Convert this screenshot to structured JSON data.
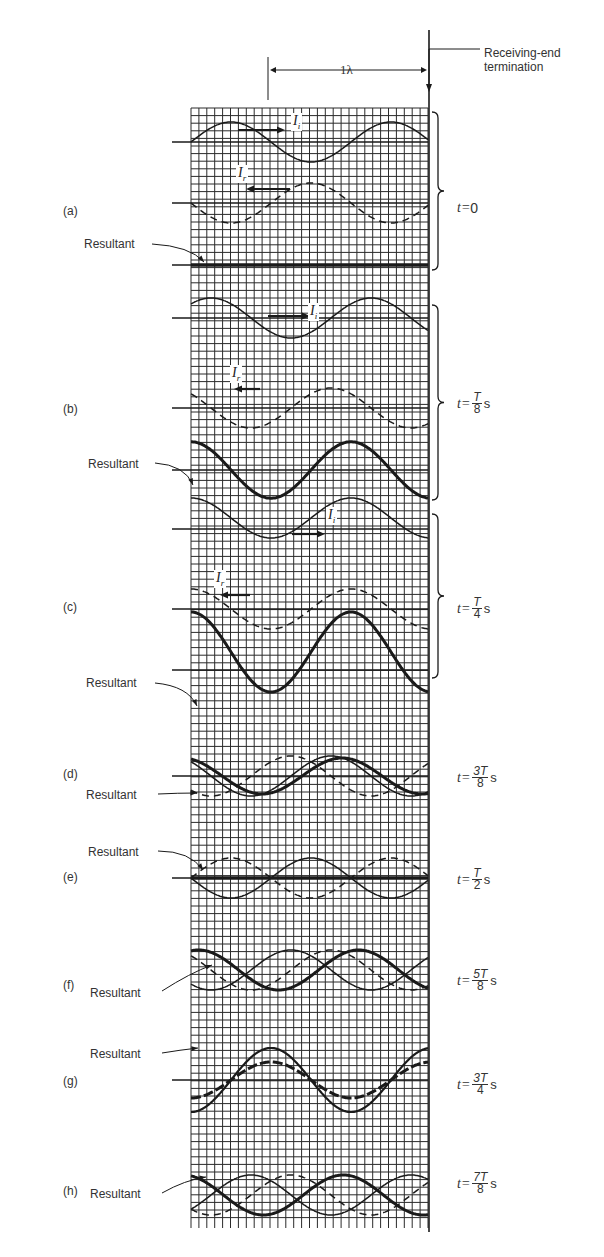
{
  "figure": {
    "wavelength_label": "1λ",
    "termination_label_line1": "Receiving-end",
    "termination_label_line2": "termination",
    "incident_symbol": "I",
    "incident_sub": "i",
    "reflected_symbol": "I",
    "reflected_sub": "r",
    "resultant_label": "Resultant"
  },
  "panels": [
    {
      "id": "a",
      "letter": "(a)",
      "time_prefix": "t=",
      "time_value": "0",
      "time_num": "",
      "time_den": "",
      "time_unit": ""
    },
    {
      "id": "b",
      "letter": "(b)",
      "time_prefix": "t=",
      "time_value": "",
      "time_num": "T",
      "time_den": "8",
      "time_unit": "s"
    },
    {
      "id": "c",
      "letter": "(c)",
      "time_prefix": "t=",
      "time_value": "",
      "time_num": "T",
      "time_den": "4",
      "time_unit": "s"
    },
    {
      "id": "d",
      "letter": "(d)",
      "time_prefix": "t=",
      "time_value": "",
      "time_num": "3T",
      "time_den": "8",
      "time_unit": "s"
    },
    {
      "id": "e",
      "letter": "(e)",
      "time_prefix": "t=",
      "time_value": "",
      "time_num": "T",
      "time_den": "2",
      "time_unit": "s"
    },
    {
      "id": "f",
      "letter": "(f)",
      "time_prefix": "t=",
      "time_value": "",
      "time_num": "5T",
      "time_den": "8",
      "time_unit": "s"
    },
    {
      "id": "g",
      "letter": "(g)",
      "time_prefix": "t=",
      "time_value": "",
      "time_num": "3T",
      "time_den": "4",
      "time_unit": "s"
    },
    {
      "id": "h",
      "letter": "(h)",
      "time_prefix": "t=",
      "time_value": "",
      "time_num": "7T",
      "time_den": "8",
      "time_unit": "s"
    }
  ],
  "colors": {
    "ink": "#1a1a1a",
    "grid": "#2a2a2a",
    "background": "#ffffff",
    "label": "#333333"
  }
}
